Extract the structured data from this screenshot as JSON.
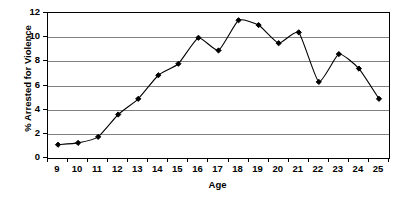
{
  "chart_data": {
    "type": "line",
    "title": "",
    "xlabel": "Age",
    "ylabel": "% Arrested for Violence",
    "x": [
      9,
      10,
      11,
      12,
      13,
      14,
      15,
      16,
      17,
      18,
      19,
      20,
      21,
      22,
      23,
      24,
      25
    ],
    "categories": [
      "9",
      "10",
      "11",
      "12",
      "13",
      "14",
      "15",
      "16",
      "17",
      "18",
      "19",
      "20",
      "21",
      "22",
      "23",
      "24",
      "25"
    ],
    "values": [
      1.1,
      1.25,
      1.75,
      3.6,
      4.9,
      6.85,
      7.8,
      9.95,
      8.9,
      11.4,
      11.0,
      9.5,
      10.4,
      6.3,
      8.6,
      7.4,
      4.9
    ],
    "series": [
      {
        "name": "% Arrested for Violence",
        "values": [
          1.1,
          1.25,
          1.75,
          3.6,
          4.9,
          6.85,
          7.8,
          9.95,
          8.9,
          11.4,
          11.0,
          9.5,
          10.4,
          6.3,
          8.6,
          7.4,
          4.9
        ]
      }
    ],
    "ylim": [
      0,
      12
    ],
    "y_ticks": [
      0,
      2,
      4,
      6,
      8,
      10,
      12
    ],
    "y_tick_labels": [
      "0",
      "2",
      "4",
      "6",
      "8",
      "10",
      "12"
    ],
    "grid": true,
    "grid_axis": "y",
    "legend": false,
    "legend_position": "none",
    "marker": "diamond",
    "line_color": "#000000",
    "marker_color": "#000000",
    "grid_color": "#808080",
    "axis_color": "#000000",
    "background_color": "#ffffff",
    "smoothed": true
  }
}
